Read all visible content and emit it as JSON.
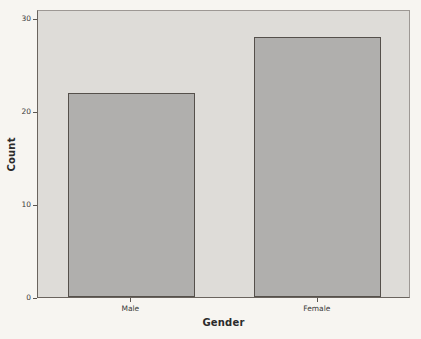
{
  "chart_data": {
    "type": "bar",
    "title": "",
    "subtitle": "",
    "categories": [
      "Male",
      "Female"
    ],
    "values": [
      22,
      28
    ],
    "xlabel": "Gender",
    "ylabel": "Count",
    "ylim": [
      0,
      31
    ],
    "yticks": [
      0,
      10,
      20,
      30
    ],
    "ytick_labels": [
      "0",
      "10",
      "20",
      "30"
    ],
    "grid": false,
    "legend": null,
    "legend_position": "none",
    "annotations": [],
    "series": [
      {
        "name": "Count",
        "values": [
          22,
          28
        ]
      }
    ]
  },
  "style": {
    "page_background": "#f7f5f1",
    "plot_background": "#dedcd8",
    "bar_fill": "#b0afad",
    "bar_border": "#55504b",
    "axis_color": "#6a645e",
    "text_color": "#2b2b2b",
    "tick_text_color": "#3a3a3a"
  }
}
